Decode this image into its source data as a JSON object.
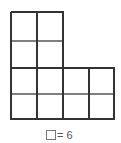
{
  "figure": {
    "columns_top": 2,
    "rows_top": 2,
    "columns_bottom": 4,
    "rows_bottom": 2,
    "total_unit_squares": 12,
    "stroke_color": "#333333",
    "inner_line_color": "#555555"
  },
  "legend": {
    "symbol": "square",
    "text": "= 6"
  }
}
